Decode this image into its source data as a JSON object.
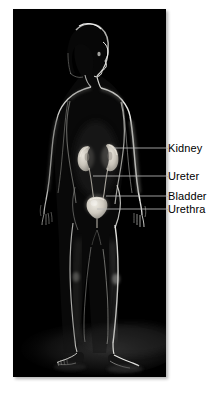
{
  "figure": {
    "kind": "anatomical-photo-illustration",
    "panel_background": "#000000",
    "page_background": "#ffffff",
    "leader_line_color": "#b9b9b9",
    "organ_highlight_color": "#d8d4cb",
    "rim_light_color": "#f2f2f0",
    "caption": ""
  },
  "annotations": {
    "items": [
      {
        "id": "kidney",
        "label": "Kidney",
        "leader_y": 148
      },
      {
        "id": "ureter",
        "label": "Ureter",
        "leader_y": 176
      },
      {
        "id": "bladder",
        "label": "Bladder",
        "leader_y": 196
      },
      {
        "id": "urethra",
        "label": "Urethra",
        "leader_y": 209
      }
    ]
  }
}
